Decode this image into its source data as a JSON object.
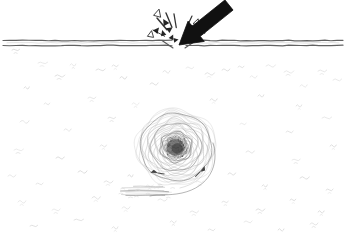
{
  "figure": {
    "title": "Projectile impact through a horizontal interface producing a subsurface vortex",
    "style": "hand-drawn pen sketch, monochrome",
    "canvas": {
      "width": 346,
      "height": 238,
      "background": "#ffffff"
    },
    "colors": {
      "background": "#ffffff",
      "ink_black": "#111111",
      "interface_line": "#5a5a5a",
      "interface_line_light": "#9b9b9b",
      "vortex_stroke": "#7d7d7d",
      "vortex_stroke_faint": "#b4b4b4",
      "vortex_core_dark": "#4a4a4a",
      "vortex_core_mid": "#6f6f6f",
      "texture_faint": "#d8d8d8",
      "debris_streak": "#8a8a8a"
    }
  },
  "elements": {
    "arrow": {
      "name": "impact-arrow",
      "description": "thick solid black arrow angled down-left striking the interface",
      "fill": "#111111",
      "tail_point": {
        "x": 229,
        "y": 5
      },
      "tip_point": {
        "x": 179,
        "y": 45
      },
      "angle_degrees": 218,
      "shaft_width": 13,
      "head_width": 26,
      "head_length": 22
    },
    "interface": {
      "name": "horizontal-interface",
      "description": "double horizontal line representing a surface or membrane, broken at the impact point",
      "y_upper": 40.5,
      "y_lower": 45.5,
      "left_segment": {
        "x_start": 3,
        "x_end": 172
      },
      "right_segment": {
        "x_start": 186,
        "x_end": 343
      },
      "gap": {
        "x_start": 172,
        "x_end": 186
      },
      "stroke_width": 1.2
    },
    "splash": {
      "name": "impact-debris-splash",
      "description": "small triangular debris fragments radiating from the impact point",
      "origin": {
        "x": 179,
        "y": 44
      },
      "count": 14,
      "fragments": [
        {
          "x": 158,
          "y": 13,
          "size": 4.0,
          "rotation": 15,
          "filled": false
        },
        {
          "x": 165,
          "y": 22,
          "size": 3.6,
          "rotation": -30,
          "filled": true
        },
        {
          "x": 157,
          "y": 30,
          "size": 3.2,
          "rotation": 40,
          "filled": true
        },
        {
          "x": 151,
          "y": 34,
          "size": 3.4,
          "rotation": 10,
          "filled": false
        },
        {
          "x": 163,
          "y": 33,
          "size": 3.0,
          "rotation": -15,
          "filled": true
        },
        {
          "x": 170,
          "y": 29,
          "size": 3.2,
          "rotation": 55,
          "filled": true
        },
        {
          "x": 172,
          "y": 37,
          "size": 2.8,
          "rotation": 25,
          "filled": true
        },
        {
          "x": 191,
          "y": 26,
          "size": 3.0,
          "rotation": -40,
          "filled": true
        },
        {
          "x": 197,
          "y": 22,
          "size": 3.4,
          "rotation": 20,
          "filled": false
        },
        {
          "x": 199,
          "y": 33,
          "size": 3.2,
          "rotation": -20,
          "filled": true
        },
        {
          "x": 192,
          "y": 36,
          "size": 3.0,
          "rotation": 60,
          "filled": true
        },
        {
          "x": 204,
          "y": 30,
          "size": 2.8,
          "rotation": 35,
          "filled": false
        },
        {
          "x": 186,
          "y": 38,
          "size": 2.6,
          "rotation": -55,
          "filled": true
        },
        {
          "x": 176,
          "y": 40,
          "size": 2.6,
          "rotation": 80,
          "filled": true
        }
      ]
    },
    "vortex": {
      "name": "subsurface-vortex",
      "description": "spiral vortex with dark core located below the interface",
      "center": {
        "x": 176,
        "y": 147
      },
      "outer_radius_x": 36,
      "outer_radius_y": 34,
      "core_radius": 9,
      "ring_count": 5,
      "spiral_turns": 2.4,
      "tail": {
        "description": "outer spiral arm curving down and to the right then sweeping left",
        "end_point": {
          "x": 150,
          "y": 196
        }
      },
      "markers": [
        {
          "name": "flow-arrow-left",
          "x": 158,
          "y": 173,
          "rotation": 205
        },
        {
          "name": "flow-arrow-right",
          "x": 200,
          "y": 172,
          "rotation": 330
        }
      ]
    },
    "debris_streak": {
      "name": "horizontal-debris-streak",
      "description": "dark horizontal smear of suspended material below and left of the vortex",
      "x_start": 118,
      "x_end": 172,
      "y": 191,
      "stroke": "#8a8a8a"
    },
    "texture": {
      "name": "suspended-particle-texture",
      "description": "scattered faint tilde-shaped marks representing suspended particles in the medium",
      "color": "#d8d8d8",
      "marks": [
        {
          "x": 12,
          "y": 50
        },
        {
          "x": 38,
          "y": 63
        },
        {
          "x": 24,
          "y": 88
        },
        {
          "x": 55,
          "y": 76
        },
        {
          "x": 70,
          "y": 65
        },
        {
          "x": 96,
          "y": 70
        },
        {
          "x": 112,
          "y": 66
        },
        {
          "x": 120,
          "y": 78
        },
        {
          "x": 150,
          "y": 84
        },
        {
          "x": 163,
          "y": 72
        },
        {
          "x": 186,
          "y": 68
        },
        {
          "x": 205,
          "y": 74
        },
        {
          "x": 222,
          "y": 70
        },
        {
          "x": 238,
          "y": 67
        },
        {
          "x": 250,
          "y": 77
        },
        {
          "x": 266,
          "y": 66
        },
        {
          "x": 284,
          "y": 72
        },
        {
          "x": 300,
          "y": 86
        },
        {
          "x": 318,
          "y": 71
        },
        {
          "x": 333,
          "y": 80
        },
        {
          "x": 44,
          "y": 104
        },
        {
          "x": 88,
          "y": 98
        },
        {
          "x": 132,
          "y": 104
        },
        {
          "x": 210,
          "y": 100
        },
        {
          "x": 258,
          "y": 96
        },
        {
          "x": 296,
          "y": 106
        },
        {
          "x": 20,
          "y": 122
        },
        {
          "x": 64,
          "y": 130
        },
        {
          "x": 108,
          "y": 118
        },
        {
          "x": 240,
          "y": 124
        },
        {
          "x": 286,
          "y": 132
        },
        {
          "x": 322,
          "y": 118
        },
        {
          "x": 14,
          "y": 150
        },
        {
          "x": 56,
          "y": 158
        },
        {
          "x": 100,
          "y": 146
        },
        {
          "x": 246,
          "y": 152
        },
        {
          "x": 292,
          "y": 160
        },
        {
          "x": 330,
          "y": 146
        },
        {
          "x": 8,
          "y": 176
        },
        {
          "x": 36,
          "y": 184
        },
        {
          "x": 78,
          "y": 172
        },
        {
          "x": 104,
          "y": 182
        },
        {
          "x": 128,
          "y": 176
        },
        {
          "x": 146,
          "y": 186
        },
        {
          "x": 196,
          "y": 182
        },
        {
          "x": 228,
          "y": 174
        },
        {
          "x": 262,
          "y": 186
        },
        {
          "x": 300,
          "y": 178
        },
        {
          "x": 326,
          "y": 190
        },
        {
          "x": 18,
          "y": 202
        },
        {
          "x": 52,
          "y": 210
        },
        {
          "x": 92,
          "y": 198
        },
        {
          "x": 122,
          "y": 208
        },
        {
          "x": 158,
          "y": 200
        },
        {
          "x": 190,
          "y": 212
        },
        {
          "x": 222,
          "y": 202
        },
        {
          "x": 256,
          "y": 210
        },
        {
          "x": 290,
          "y": 200
        },
        {
          "x": 318,
          "y": 212
        },
        {
          "x": 30,
          "y": 226
        },
        {
          "x": 74,
          "y": 220
        },
        {
          "x": 112,
          "y": 228
        },
        {
          "x": 170,
          "y": 222
        },
        {
          "x": 208,
          "y": 230
        },
        {
          "x": 244,
          "y": 222
        },
        {
          "x": 278,
          "y": 230
        },
        {
          "x": 310,
          "y": 224
        }
      ]
    }
  }
}
